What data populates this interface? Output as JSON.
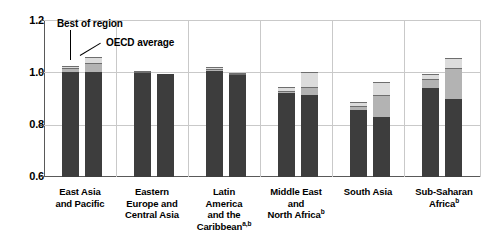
{
  "chart_data": {
    "type": "bar",
    "title": "",
    "subtitle": "",
    "xlabel": "",
    "ylabel": "",
    "ylim": [
      0.6,
      1.2
    ],
    "yticks": [
      "0.6",
      "0.8",
      "1.0",
      "1.2"
    ],
    "ytick_values": [
      0.6,
      0.8,
      1.0,
      1.2
    ],
    "grid": "horizontal gridlines at 0.8, 1.0, 1.2 plus vertical group separators",
    "legend_position": "inline annotations with leader lines",
    "stacked": true,
    "bars_per_group": 2,
    "segment_names": [
      "dark",
      "mid",
      "light"
    ],
    "annotations": [
      {
        "text": "Best of region",
        "points_to": "group 1, left bar"
      },
      {
        "text": "OECD average",
        "points_to": "group 1, right bar"
      }
    ],
    "categories": [
      "East Asia and Pacific",
      "Eastern Europe and Central Asia",
      "Latin America and the Caribbean",
      "Middle East and North Africa",
      "South Asia",
      "Sub-Saharan Africa"
    ],
    "groups": [
      {
        "category": "East Asia and Pacific",
        "label_lines": [
          "East Asia",
          "and Pacific"
        ],
        "footnotes": "",
        "bars": [
          {
            "name": "Best of region",
            "segments": [
              1.0,
              1.015,
              1.025
            ],
            "total": 1.025
          },
          {
            "name": "OECD average",
            "segments": [
              1.0,
              1.035,
              1.06
            ],
            "total": 1.06
          }
        ]
      },
      {
        "category": "Eastern Europe and Central Asia",
        "label_lines": [
          "Eastern",
          "Europe and",
          "Central Asia"
        ],
        "footnotes": "",
        "bars": [
          {
            "name": "Best of region",
            "segments": [
              0.998,
              1.002,
              1.005
            ],
            "total": 1.005
          },
          {
            "name": "OECD average",
            "segments": [
              0.995,
              0.996,
              0.997
            ],
            "total": 0.997
          }
        ]
      },
      {
        "category": "Latin America and the Caribbean",
        "label_lines": [
          "Latin",
          "America",
          "and the",
          "Caribbean"
        ],
        "footnotes": "a,b",
        "bars": [
          {
            "name": "Best of region",
            "segments": [
              1.005,
              1.012,
              1.022
            ],
            "total": 1.022
          },
          {
            "name": "OECD average",
            "segments": [
              0.988,
              0.993,
              0.998
            ],
            "total": 0.998
          }
        ]
      },
      {
        "category": "Middle East and North Africa",
        "label_lines": [
          "Middle East",
          "and",
          "North Africa"
        ],
        "footnotes": "b",
        "bars": [
          {
            "name": "Best of region",
            "segments": [
              0.922,
              0.93,
              0.945
            ],
            "total": 0.945
          },
          {
            "name": "OECD average",
            "segments": [
              0.915,
              0.945,
              1.0
            ],
            "total": 1.0
          }
        ]
      },
      {
        "category": "South Asia",
        "label_lines": [
          "South Asia"
        ],
        "footnotes": "",
        "bars": [
          {
            "name": "Best of region",
            "segments": [
              0.855,
              0.872,
              0.886
            ],
            "total": 0.886
          },
          {
            "name": "OECD average",
            "segments": [
              0.83,
              0.915,
              0.965
            ],
            "total": 0.965
          }
        ]
      },
      {
        "category": "Sub-Saharan Africa",
        "label_lines": [
          "Sub-Saharan",
          "Africa"
        ],
        "footnotes": "b",
        "bars": [
          {
            "name": "Best of region",
            "segments": [
              0.94,
              0.975,
              0.995
            ],
            "total": 0.995
          },
          {
            "name": "OECD average",
            "segments": [
              0.9,
              1.015,
              1.055
            ],
            "total": 1.055
          }
        ]
      }
    ],
    "colors": {
      "dark": "#3d3d3d",
      "mid": "#b3b3b3",
      "light": "#dcdcdc",
      "gridline": "#c9c9c9",
      "axis": "#595959",
      "text": "#000000",
      "background": "#ffffff"
    }
  },
  "axis": {
    "y_ticks": [
      "1.2",
      "1.0",
      "0.8",
      "0.6"
    ]
  },
  "annotations": {
    "best_of_region": "Best of region",
    "oecd_average": "OECD average"
  },
  "labels": {
    "g0": {
      "l0": "East Asia",
      "l1": "and Pacific",
      "fn": ""
    },
    "g1": {
      "l0": "Eastern",
      "l1": "Europe and",
      "l2": "Central Asia",
      "fn": ""
    },
    "g2": {
      "l0": "Latin",
      "l1": "America",
      "l2": "and the",
      "l3": "Caribbean",
      "fn": "a,b"
    },
    "g3": {
      "l0": "Middle East",
      "l1": "and",
      "l2": "North Africa",
      "fn": "b"
    },
    "g4": {
      "l0": "South Asia",
      "fn": ""
    },
    "g5": {
      "l0": "Sub-Saharan",
      "l1": "Africa",
      "fn": "b"
    }
  }
}
